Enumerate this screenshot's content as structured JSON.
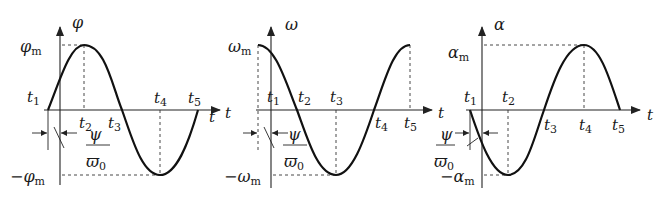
{
  "figure": {
    "panels": [
      {
        "id": "angle",
        "y_label": "φ",
        "x_label": "t",
        "max_label": "φ",
        "max_sub": "m",
        "min_label": "−φ",
        "min_sub": "m",
        "time_marks": [
          "t1",
          "t2",
          "t3",
          "t4",
          "t5"
        ],
        "phase_label_num": "ψ",
        "phase_label_den": "ϖ",
        "phase_label_den_sub": "0",
        "curve": "sine"
      },
      {
        "id": "angular-velocity",
        "y_label": "ω",
        "x_label": "t",
        "max_label": "ω",
        "max_sub": "m",
        "min_label": "−ω",
        "min_sub": "m",
        "time_marks": [
          "t1",
          "t2",
          "t3",
          "t4",
          "t5"
        ],
        "phase_label_num": "ψ",
        "phase_label_den": "ϖ",
        "phase_label_den_sub": "0",
        "curve": "cosine"
      },
      {
        "id": "angular-acceleration",
        "y_label": "α",
        "x_label": "t",
        "max_label": "α",
        "max_sub": "m",
        "min_label": "−α",
        "min_sub": "m",
        "time_marks": [
          "t1",
          "t2",
          "t3",
          "t4",
          "t5"
        ],
        "phase_label_num": "ψ",
        "phase_label_den": "ϖ",
        "phase_label_den_sub": "0",
        "curve": "negative-sine"
      }
    ],
    "t_letter": "t",
    "subscripts": [
      "1",
      "2",
      "3",
      "4",
      "5"
    ]
  }
}
